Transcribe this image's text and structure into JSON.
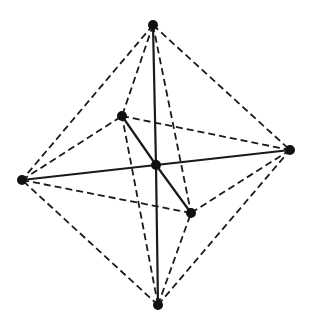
{
  "diagram": {
    "title": "",
    "type": "octahedron-wireframe",
    "colors": {
      "background": "#ffffff",
      "line": "#1a1a1a",
      "vertex": "#111111"
    },
    "vertices": [
      {
        "id": "top",
        "x": 153,
        "y": 25
      },
      {
        "id": "back-left",
        "x": 122,
        "y": 116
      },
      {
        "id": "right",
        "x": 290,
        "y": 150
      },
      {
        "id": "center",
        "x": 156,
        "y": 165
      },
      {
        "id": "left",
        "x": 22,
        "y": 180
      },
      {
        "id": "front-right",
        "x": 191,
        "y": 213
      },
      {
        "id": "bottom",
        "x": 158,
        "y": 305
      }
    ],
    "solid_edges": [
      [
        "top",
        "center"
      ],
      [
        "center",
        "bottom"
      ],
      [
        "left",
        "center"
      ],
      [
        "center",
        "right"
      ],
      [
        "back-left",
        "center"
      ],
      [
        "center",
        "front-right"
      ]
    ],
    "dashed_edges": [
      [
        "top",
        "left"
      ],
      [
        "top",
        "back-left"
      ],
      [
        "top",
        "right"
      ],
      [
        "top",
        "front-right"
      ],
      [
        "bottom",
        "left"
      ],
      [
        "bottom",
        "back-left"
      ],
      [
        "bottom",
        "right"
      ],
      [
        "bottom",
        "front-right"
      ],
      [
        "left",
        "back-left"
      ],
      [
        "back-left",
        "right"
      ],
      [
        "right",
        "front-right"
      ],
      [
        "front-right",
        "left"
      ]
    ]
  }
}
